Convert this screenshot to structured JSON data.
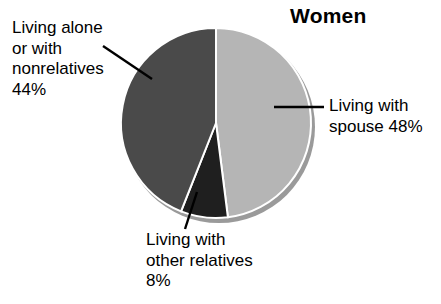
{
  "chart_data": {
    "type": "pie",
    "title": "Women",
    "xlabel": "",
    "ylabel": "",
    "legend_position": "none",
    "grid": false,
    "units": "percent",
    "categories": [
      "Living with spouse",
      "Living with other relatives",
      "Living alone or with nonrelatives"
    ],
    "values": [
      48,
      8,
      44
    ],
    "colors": [
      "#b5b5b5",
      "#1f1f1f",
      "#4a4a4a"
    ],
    "start_angle_deg": 0,
    "direction": "clockwise",
    "slices": [
      {
        "name": "Living with spouse",
        "value": 48,
        "percent_label": "48%",
        "color": "#b5b5b5",
        "start_deg": 0,
        "end_deg": 172.8,
        "annotation_lines": [
          "Living with",
          "spouse 48%"
        ],
        "annotation_position": "right"
      },
      {
        "name": "Living with other relatives",
        "value": 8,
        "percent_label": "8%",
        "color": "#1f1f1f",
        "start_deg": 172.8,
        "end_deg": 201.6,
        "annotation_lines": [
          "Living with",
          "other relatives",
          "8%"
        ],
        "annotation_position": "bottom"
      },
      {
        "name": "Living alone or with nonrelatives",
        "value": 44,
        "percent_label": "44%",
        "color": "#4a4a4a",
        "start_deg": 201.6,
        "end_deg": 360,
        "annotation_lines": [
          "Living alone",
          "or with",
          "nonrelatives",
          "44%"
        ],
        "annotation_position": "left"
      }
    ],
    "annotations": [
      {
        "id": "living-alone",
        "text": "Living alone\nor with\nnonrelatives\n44%",
        "leader_from": [
          103,
          46
        ],
        "leader_to": [
          152,
          79
        ]
      },
      {
        "id": "living-with-spouse",
        "text": "Living with\nspouse 48%",
        "leader_from": [
          324,
          107
        ],
        "leader_to": [
          274,
          107
        ]
      },
      {
        "id": "living-with-other-relatives",
        "text": "Living with\nother relatives\n8%",
        "leader_from": [
          185,
          229
        ],
        "leader_to": [
          197,
          192
        ]
      }
    ]
  },
  "title": {
    "text": "Women"
  },
  "labels": {
    "living_alone": "Living alone\nor with\nnonrelatives\n44%",
    "living_with_spouse": "Living with\nspouse 48%",
    "living_with_other_relatives": "Living with\nother relatives\n8%"
  },
  "style": {
    "background": "#ffffff",
    "text_color": "#000000",
    "separator_color": "#ffffff",
    "shadow_color": "#9a9a9a",
    "leader_line_color": "#000000"
  }
}
